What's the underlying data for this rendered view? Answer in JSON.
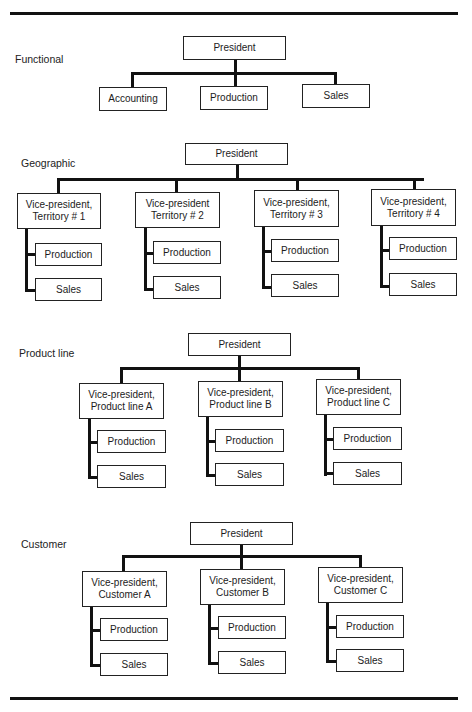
{
  "sections": [
    {
      "label": "Functional",
      "president": "President",
      "units": [
        "Accounting",
        "Production",
        "Sales"
      ]
    },
    {
      "label": "Geographic",
      "president": "President",
      "vps": [
        {
          "title": "Vice-president,\nTerritory # 1",
          "line1": "Vice-president,",
          "line2": "Territory # 1",
          "children": [
            "Production",
            "Sales"
          ]
        },
        {
          "title": "Vice-president\nTerritory # 2",
          "line1": "Vice-president",
          "line2": "Territory # 2",
          "children": [
            "Production",
            "Sales"
          ]
        },
        {
          "title": "Vice-president,\nTerritory # 3",
          "line1": "Vice-president,",
          "line2": "Territory  # 3",
          "children": [
            "Production",
            "Sales"
          ]
        },
        {
          "title": "Vice-president,\nTerritory # 4",
          "line1": "Vice-president,",
          "line2": "Territory # 4",
          "children": [
            "Production",
            "Sales"
          ]
        }
      ]
    },
    {
      "label": "Product line",
      "president": "President",
      "vps": [
        {
          "line1": "Vice-president,",
          "line2": "Product line A",
          "children": [
            "Production",
            "Sales"
          ]
        },
        {
          "line1": "Vice-president,",
          "line2": "Product line B",
          "children": [
            "Production",
            "Sales"
          ]
        },
        {
          "line1": "Vice-president,",
          "line2": "Product line C",
          "children": [
            "Production",
            "Sales"
          ]
        }
      ]
    },
    {
      "label": "Customer",
      "president": "President",
      "vps": [
        {
          "line1": "Vice-president,",
          "line2": "Customer A",
          "children": [
            "Production",
            "Sales"
          ]
        },
        {
          "line1": "Vice-president,",
          "line2": "Customer B",
          "children": [
            "Production",
            "Sales"
          ]
        },
        {
          "line1": "Vice-president,",
          "line2": "Customer C",
          "children": [
            "Production",
            "Sales"
          ]
        }
      ]
    }
  ]
}
